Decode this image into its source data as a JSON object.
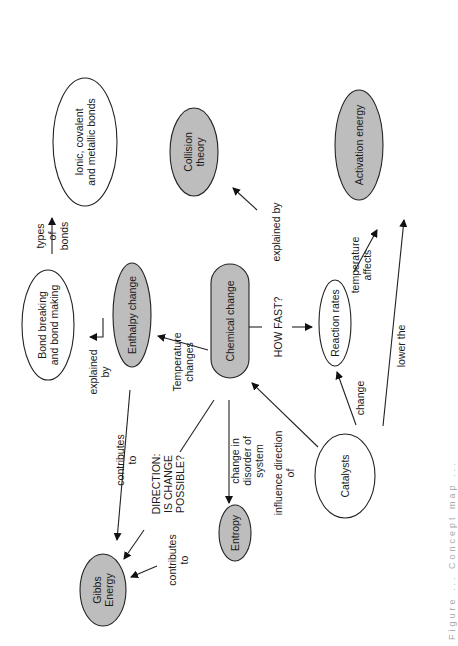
{
  "diagram": {
    "type": "concept-map",
    "orientation": "rotated-90-ccw",
    "caption": "Figure ... Concept map ...",
    "colors": {
      "filled": "#bdbdbd",
      "outline": "#222222",
      "background": "#ffffff",
      "text": "#1a1a1a"
    },
    "nodes": [
      {
        "id": "ionic",
        "label": [
          "Ionic, covalent",
          "and metallic bonds"
        ],
        "cx": 85,
        "cy": 142,
        "rx": 32,
        "ry": 64,
        "filled": false,
        "shape": "ellipse"
      },
      {
        "id": "collision",
        "label": [
          "Collision",
          "theory"
        ],
        "cx": 194,
        "cy": 152,
        "rx": 24,
        "ry": 44,
        "filled": true,
        "shape": "ellipse"
      },
      {
        "id": "activation",
        "label": [
          "Activation energy"
        ],
        "cx": 359,
        "cy": 145,
        "rx": 24,
        "ry": 55,
        "filled": true,
        "shape": "ellipse"
      },
      {
        "id": "bond",
        "label": [
          "Bond breaking",
          "and bond making"
        ],
        "cx": 48,
        "cy": 325,
        "rx": 26,
        "ry": 55,
        "filled": false,
        "shape": "ellipse"
      },
      {
        "id": "enthalpy",
        "label": [
          "Enthalpy change"
        ],
        "cx": 132,
        "cy": 315,
        "rx": 19,
        "ry": 52,
        "filled": true,
        "shape": "ellipse"
      },
      {
        "id": "chemical",
        "label": [
          "Chemical change"
        ],
        "cx": 230,
        "cy": 321,
        "rx": 19,
        "ry": 57,
        "filled": true,
        "shape": "pill"
      },
      {
        "id": "reaction",
        "label": [
          "Reaction rates"
        ],
        "cx": 335,
        "cy": 323,
        "rx": 16,
        "ry": 43,
        "filled": false,
        "shape": "ellipse"
      },
      {
        "id": "gibbs",
        "label": [
          "Gibbs",
          "Energy"
        ],
        "cx": 103,
        "cy": 590,
        "rx": 23,
        "ry": 36,
        "filled": true,
        "shape": "ellipse"
      },
      {
        "id": "entropy",
        "label": [
          "Entropy"
        ],
        "cx": 235,
        "cy": 533,
        "rx": 16,
        "ry": 28,
        "filled": true,
        "shape": "ellipse"
      },
      {
        "id": "catalysts",
        "label": [
          "Catalysts"
        ],
        "cx": 345,
        "cy": 476,
        "rx": 30,
        "ry": 42,
        "filled": false,
        "shape": "ellipse"
      }
    ],
    "edges": [
      {
        "from": "bond",
        "to": "ionic",
        "label": [
          "types",
          "of",
          "bonds"
        ],
        "pts": [
          [
            52,
            254
          ],
          [
            52,
            218
          ]
        ],
        "arrow": true
      },
      {
        "from": "enthalpy",
        "to": "bond",
        "label": [
          "explained",
          "by"
        ],
        "pts": [
          [
            103,
            318
          ],
          [
            103,
            337
          ],
          [
            90,
            337
          ]
        ],
        "arrow": true
      },
      {
        "from": "chemical",
        "to": "enthalpy",
        "label": [
          "Temperature",
          "changes"
        ],
        "pts": [
          [
            208,
            350
          ],
          [
            158,
            336
          ]
        ],
        "arrow": true
      },
      {
        "from": "enthalpy",
        "to": "gibbs",
        "label": [
          "contributes",
          "to"
        ],
        "pts": [
          [
            130,
            390
          ],
          [
            117,
            540
          ]
        ],
        "arrow": true
      },
      {
        "from": "chemical",
        "to": "gibbs",
        "label": [
          "DIRECTION:",
          "IS CHANGE",
          "POSSIBLE?"
        ],
        "pts": [
          [
            214,
            400
          ],
          [
            180,
            452
          ],
          "break",
          [
            144,
            530
          ],
          [
            124,
            559
          ]
        ],
        "arrow": true
      },
      {
        "from": "entropy",
        "to": "gibbs",
        "label": [
          "contributes",
          "to"
        ],
        "pts": [
          [
            206,
            530
          ],
          "break",
          [
            157,
            566
          ],
          [
            131,
            577
          ]
        ],
        "arrow": true
      },
      {
        "from": "chemical",
        "to": "entropy",
        "label": [
          "change in",
          "disorder of",
          "system"
        ],
        "pts": [
          [
            229,
            400
          ],
          [
            229,
            503
          ]
        ],
        "arrow": true
      },
      {
        "from": "catalysts",
        "to": "chemical",
        "label": [
          "influence direction",
          "of"
        ],
        "pts": [
          [
            318,
            447
          ],
          [
            252,
            383
          ]
        ],
        "arrow": true
      },
      {
        "from": "chemical",
        "to": "reaction",
        "label": [
          "HOW FAST?"
        ],
        "pts": [
          [
            249,
            327
          ],
          [
            262,
            327
          ],
          "break",
          [
            292,
            327
          ],
          [
            312,
            327
          ]
        ],
        "arrow": true
      },
      {
        "from": "catalysts",
        "to": "reaction",
        "label": [
          "change"
        ],
        "pts": [
          [
            356,
            425
          ],
          [
            337,
            372
          ]
        ],
        "arrow": true
      },
      {
        "from": "reaction",
        "to": "collision",
        "label": [
          "explained by"
        ],
        "pts": [
          [
            319,
            276
          ],
          "break",
          [
            257,
            210
          ],
          [
            233,
            188
          ]
        ],
        "arrow": true
      },
      {
        "from": "reaction",
        "to": "activation",
        "label": [
          "temperature",
          "affects"
        ],
        "pts": [
          [
            354,
            272
          ],
          [
            377,
            230
          ]
        ],
        "arrow": true
      },
      {
        "from": "catalysts",
        "to": "activation",
        "label": [
          "lower the"
        ],
        "pts": [
          [
            383,
            426
          ],
          [
            404,
            220
          ]
        ],
        "arrow": true
      }
    ],
    "edge_labels": [
      {
        "text": [
          "types",
          "of",
          "bonds"
        ],
        "x": 52,
        "y": 236
      },
      {
        "text": [
          "explained",
          "by"
        ],
        "x": 99,
        "y": 372
      },
      {
        "text": [
          "Temperature",
          "changes"
        ],
        "x": 183,
        "y": 362
      },
      {
        "text": [
          "contributes",
          "to"
        ],
        "x": 126,
        "y": 460
      },
      {
        "text": [
          "DIRECTION:",
          "IS CHANGE",
          "POSSIBLE?"
        ],
        "x": 168,
        "y": 484
      },
      {
        "text": [
          "contributes",
          "to"
        ],
        "x": 178,
        "y": 560
      },
      {
        "text": [
          "change in",
          "disorder of",
          "system"
        ],
        "x": 247,
        "y": 461
      },
      {
        "text": [
          "influence direction",
          "of"
        ],
        "x": 284,
        "y": 473
      },
      {
        "text": [
          "HOW FAST?"
        ],
        "x": 278,
        "y": 327
      },
      {
        "text": [
          "change"
        ],
        "x": 360,
        "y": 398
      },
      {
        "text": [
          "explained by"
        ],
        "x": 276,
        "y": 232
      },
      {
        "text": [
          "temperature",
          "affects"
        ],
        "x": 361,
        "y": 265
      },
      {
        "text": [
          "lower the"
        ],
        "x": 401,
        "y": 346
      }
    ]
  }
}
